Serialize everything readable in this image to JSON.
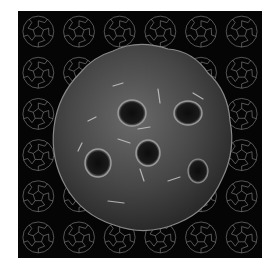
{
  "image": {
    "description": "3D rendered fullerene-like molecule over a grid of wireframe buckyballs",
    "background_color": "#050505",
    "page_color": "#ffffff",
    "molecule_color": "#4a4a4a",
    "wireframe_color": "#8a8a8a",
    "grid": {
      "rows": 6,
      "cols": 6
    },
    "molecule": {
      "holes": 5
    }
  }
}
